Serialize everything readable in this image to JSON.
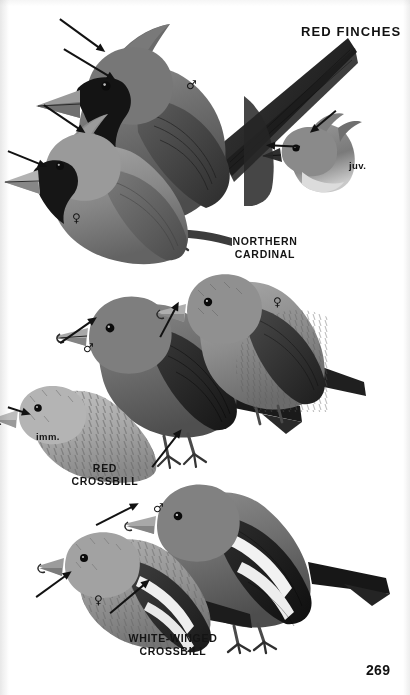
{
  "page": {
    "plate_title": "RED FINCHES",
    "page_number": "269",
    "background_color": "#ffffff",
    "ink_color": "#121212"
  },
  "species": [
    {
      "id": "northern-cardinal",
      "label": "NORTHERN\nCARDINAL",
      "label_pos": {
        "x": 222,
        "y": 235
      },
      "figures": [
        {
          "id": "cardinal-male",
          "sex_mark": "♂",
          "mark_pos": {
            "x": 186,
            "y": 79
          }
        },
        {
          "id": "cardinal-female",
          "sex_mark": "♀",
          "mark_pos": {
            "x": 72,
            "y": 212
          }
        },
        {
          "id": "cardinal-juvenile",
          "age_mark": "juv.",
          "mark_pos": {
            "x": 349,
            "y": 160
          }
        }
      ]
    },
    {
      "id": "red-crossbill",
      "label": "RED\nCROSSBILL",
      "label_pos": {
        "x": 62,
        "y": 462
      },
      "figures": [
        {
          "id": "redcross-male",
          "sex_mark": "♂",
          "mark_pos": {
            "x": 83,
            "y": 342
          }
        },
        {
          "id": "redcross-female",
          "sex_mark": "♀",
          "mark_pos": {
            "x": 273,
            "y": 296
          }
        },
        {
          "id": "redcross-imm",
          "age_mark": "imm.",
          "mark_pos": {
            "x": 36,
            "y": 431
          }
        }
      ]
    },
    {
      "id": "white-winged-crossbill",
      "label": "WHITE-WINGED\nCROSSBILL",
      "label_pos": {
        "x": 118,
        "y": 632
      },
      "figures": [
        {
          "id": "wwcross-male",
          "sex_mark": "♂",
          "mark_pos": {
            "x": 153,
            "y": 502
          }
        },
        {
          "id": "wwcross-female",
          "sex_mark": "♀",
          "mark_pos": {
            "x": 94,
            "y": 594
          }
        }
      ]
    }
  ],
  "arrows": [
    {
      "id": "arrow-cardinal-male-crest",
      "x": 60,
      "y": 14,
      "length": 56,
      "angle": 36,
      "points_to": "crest"
    },
    {
      "id": "arrow-cardinal-male-face",
      "x": 64,
      "y": 44,
      "length": 60,
      "angle": 31,
      "points_to": "black-face-mask"
    },
    {
      "id": "arrow-cardinal-female-crest",
      "x": 44,
      "y": 100,
      "length": 50,
      "angle": 34,
      "points_to": "crest"
    },
    {
      "id": "arrow-cardinal-female-bill",
      "x": 8,
      "y": 146,
      "length": 42,
      "angle": 22,
      "points_to": "conical-red-bill"
    },
    {
      "id": "arrow-juvenile-crest",
      "x": 336,
      "y": 106,
      "length": 34,
      "angle": 140,
      "points_to": "crest"
    },
    {
      "id": "arrow-juvenile-bill",
      "x": 300,
      "y": 142,
      "length": 34,
      "angle": 183,
      "points_to": "dark-bill"
    },
    {
      "id": "arrow-redcross-male-bill",
      "x": 60,
      "y": 338,
      "length": 45,
      "angle": -35,
      "points_to": "crossed-bill"
    },
    {
      "id": "arrow-redcross-female-bill",
      "x": 160,
      "y": 332,
      "length": 40,
      "angle": -62,
      "points_to": "crossed-bill"
    },
    {
      "id": "arrow-redcross-imm-bill",
      "x": 8,
      "y": 402,
      "length": 24,
      "angle": 18,
      "points_to": "crossed-bill"
    },
    {
      "id": "arrow-redcross-plain-wing",
      "x": 152,
      "y": 462,
      "length": 48,
      "angle": -52,
      "points_to": "plain-dark-wing"
    },
    {
      "id": "arrow-wwcross-male-wingbar",
      "x": 96,
      "y": 520,
      "length": 48,
      "angle": -27,
      "points_to": "white-wing-bars"
    },
    {
      "id": "arrow-wwcross-female-bill",
      "x": 36,
      "y": 592,
      "length": 44,
      "angle": -36,
      "points_to": "crossed-bill"
    },
    {
      "id": "arrow-wwcross-female-bars",
      "x": 110,
      "y": 608,
      "length": 52,
      "angle": -40,
      "points_to": "white-wing-bars"
    }
  ]
}
